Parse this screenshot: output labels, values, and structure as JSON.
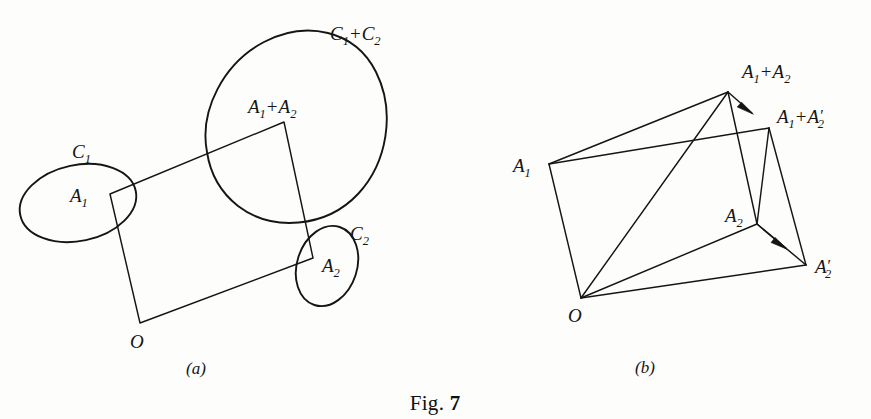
{
  "figure": {
    "caption_text": "Fig.",
    "caption_number": "7",
    "background_color": "#fdfdfc",
    "ink_color": "#151515",
    "width": 871,
    "height": 419
  },
  "panel_a": {
    "caption": "(a)",
    "caption_x": 196,
    "caption_y": 374,
    "labels": {
      "origin": "O",
      "a1_base": "A",
      "a1_sub": "1",
      "a2_base": "A",
      "a2_sub": "2",
      "plus": "+",
      "c1_base": "C",
      "c1_sub": "1",
      "c2_base": "C",
      "c2_sub": "2"
    },
    "label_positions": {
      "origin": {
        "x": 130,
        "y": 348
      },
      "a1": {
        "x": 70,
        "y": 202
      },
      "a2": {
        "x": 322,
        "y": 272
      },
      "a1_plus_a2": {
        "x": 248,
        "y": 113
      },
      "c1": {
        "x": 72,
        "y": 158
      },
      "c2": {
        "x": 350,
        "y": 240
      },
      "c1_plus_c2": {
        "x": 330,
        "y": 40
      }
    },
    "parallelogram": {
      "points": "140,323 110,194 284,122 313,258",
      "vertices": {
        "O": {
          "x": 140,
          "y": 323
        },
        "A1": {
          "x": 110,
          "y": 194
        },
        "A1A2": {
          "x": 284,
          "y": 122
        },
        "A2": {
          "x": 313,
          "y": 258
        }
      }
    },
    "curves": {
      "c1_ellipse": {
        "cx": 78,
        "cy": 203,
        "rx": 59,
        "ry": 38,
        "rotation": -12
      },
      "c2_ellipse": {
        "cx": 327,
        "cy": 266,
        "rx": 30,
        "ry": 41,
        "rotation": 18
      },
      "c1_plus_c2_blob_path": "M 207,152 C 199,110 224,63 264,42 C 306,20 355,30 376,72 C 396,112 387,163 358,194 C 326,228 272,232 238,206 C 219,191 210,172 207,152 Z"
    }
  },
  "panel_b": {
    "caption": "(b)",
    "caption_x": 645,
    "caption_y": 373,
    "labels": {
      "origin": "O",
      "a_base": "A",
      "sub1": "1",
      "sub2": "2",
      "plus": "+",
      "prime": "′"
    },
    "label_positions": {
      "origin": {
        "x": 568,
        "y": 322
      },
      "a1": {
        "x": 513,
        "y": 172
      },
      "a2": {
        "x": 725,
        "y": 222
      },
      "a1_plus_a2": {
        "x": 742,
        "y": 78
      },
      "a1_plus_a2prime": {
        "x": 777,
        "y": 123
      },
      "a2prime": {
        "x": 815,
        "y": 273
      }
    },
    "vertices": {
      "O": {
        "x": 581,
        "y": 298
      },
      "A1": {
        "x": 549,
        "y": 164
      },
      "A1A2": {
        "x": 728,
        "y": 92
      },
      "A1A2prime": {
        "x": 769,
        "y": 128
      },
      "A2": {
        "x": 757,
        "y": 224
      },
      "A2prime": {
        "x": 806,
        "y": 265
      }
    },
    "edges": [
      {
        "name": "O-A1",
        "from": "O",
        "to": "A1"
      },
      {
        "name": "O-A1A2",
        "from": "O",
        "to": "A1A2"
      },
      {
        "name": "O-A2",
        "from": "O",
        "to": "A2"
      },
      {
        "name": "O-A2prime",
        "from": "O",
        "to": "A2prime"
      },
      {
        "name": "A1-A1A2",
        "from": "A1",
        "to": "A1A2"
      },
      {
        "name": "A1-A1A2prime",
        "from": "A1",
        "to": "A1A2prime"
      },
      {
        "name": "A1A2-A2",
        "from": "A1A2",
        "to": "A2"
      },
      {
        "name": "A1A2prime-A2prime",
        "from": "A1A2prime",
        "to": "A2prime"
      },
      {
        "name": "A2-A2prime",
        "from": "A2",
        "to": "A2prime"
      },
      {
        "name": "A1A2prime-A2",
        "from": "A1A2prime",
        "to": "A2"
      }
    ],
    "arrows": [
      {
        "name": "arrow-a1a2-to-a1a2prime",
        "from": "A1A2",
        "to": "A1A2prime"
      },
      {
        "name": "arrow-a2-to-a2prime",
        "from": "A2",
        "to": "A2prime"
      }
    ]
  }
}
